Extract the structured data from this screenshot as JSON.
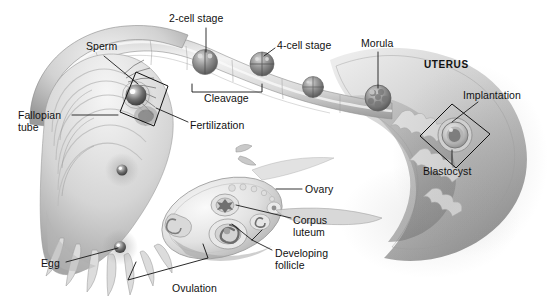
{
  "figure": {
    "background_color": "#ffffff",
    "ink_color": "#111111",
    "art_palette": {
      "tissue_light": "#e9e9e9",
      "tissue_mid": "#c6c6c6",
      "tissue_dark": "#8f8f8f",
      "tissue_shadow": "#6a6a6a",
      "cell_dark": "#5d5d5d",
      "outline": "#6f6f6f"
    }
  },
  "labels": [
    {
      "id": "sperm",
      "text": "Sperm",
      "x": 86,
      "y": 41,
      "align": "left",
      "bold": false
    },
    {
      "id": "two_cell_stage",
      "text": "2-cell stage",
      "x": 169,
      "y": 13,
      "align": "left",
      "bold": false
    },
    {
      "id": "four_cell_stage",
      "text": "4-cell stage",
      "x": 277,
      "y": 40,
      "align": "left",
      "bold": false
    },
    {
      "id": "morula",
      "text": "Morula",
      "x": 361,
      "y": 38,
      "align": "left",
      "bold": false
    },
    {
      "id": "uterus",
      "text": "UTERUS",
      "x": 424,
      "y": 59,
      "align": "left",
      "bold": true
    },
    {
      "id": "implantation",
      "text": "Implantation",
      "x": 463,
      "y": 90,
      "align": "left",
      "bold": false
    },
    {
      "id": "fallopian_tube",
      "text": "Fallopian\ntube",
      "x": 18,
      "y": 110,
      "align": "left",
      "bold": false
    },
    {
      "id": "cleavage",
      "text": "Cleavage",
      "x": 204,
      "y": 93,
      "align": "left",
      "bold": false
    },
    {
      "id": "fertilization",
      "text": "Fertilization",
      "x": 190,
      "y": 120,
      "align": "left",
      "bold": false
    },
    {
      "id": "blastocyst",
      "text": "Blastocyst",
      "x": 423,
      "y": 166,
      "align": "left",
      "bold": false
    },
    {
      "id": "ovary",
      "text": "Ovary",
      "x": 305,
      "y": 184,
      "align": "left",
      "bold": false
    },
    {
      "id": "corpus_luteum",
      "text": "Corpus\nluteum",
      "x": 293,
      "y": 215,
      "align": "left",
      "bold": false
    },
    {
      "id": "developing_follicle",
      "text": "Developing\nfollicle",
      "x": 275,
      "y": 248,
      "align": "left",
      "bold": false
    },
    {
      "id": "egg",
      "text": "Egg",
      "x": 41,
      "y": 258,
      "align": "left",
      "bold": false
    },
    {
      "id": "ovulation",
      "text": "Ovulation",
      "x": 172,
      "y": 283,
      "align": "left",
      "bold": false
    }
  ],
  "structures": [
    {
      "id": "fallopian-tube",
      "name": "Fallopian tube"
    },
    {
      "id": "fimbriae",
      "name": "Fimbriae"
    },
    {
      "id": "ovary",
      "name": "Ovary"
    },
    {
      "id": "uterus-wall",
      "name": "Uterus wall"
    },
    {
      "id": "endometrium",
      "name": "Endometrium"
    },
    {
      "id": "corpus-luteum",
      "name": "Corpus luteum"
    },
    {
      "id": "developing-follicle",
      "name": "Developing follicle"
    }
  ],
  "embryo_stages": [
    {
      "id": "zygote",
      "name": "Fertilized egg / zygote",
      "cx": 138,
      "cy": 98,
      "r": 11
    },
    {
      "id": "two-cell",
      "name": "2-cell stage",
      "cx": 205,
      "cy": 62,
      "r": 11
    },
    {
      "id": "four-cell",
      "name": "4-cell stage",
      "cx": 262,
      "cy": 64,
      "r": 11
    },
    {
      "id": "eight-cell",
      "name": "8-cell stage",
      "cx": 313,
      "cy": 87,
      "r": 10
    },
    {
      "id": "morula",
      "name": "Morula",
      "cx": 378,
      "cy": 98,
      "r": 12
    },
    {
      "id": "blastocyst",
      "name": "Blastocyst",
      "cx": 455,
      "cy": 135,
      "r": 14
    },
    {
      "id": "ovum",
      "name": "Ovulated egg",
      "cx": 120,
      "cy": 247,
      "r": 7
    }
  ],
  "callouts": [
    {
      "id": "fertilization-diamond",
      "name": "Fertilization callout diamond"
    },
    {
      "id": "implantation-diamond",
      "name": "Implantation callout diamond"
    }
  ],
  "brackets": [
    {
      "id": "cleavage-bracket",
      "name": "Cleavage span bracket"
    },
    {
      "id": "ovulation-bracket",
      "name": "Ovulation span bracket"
    }
  ]
}
